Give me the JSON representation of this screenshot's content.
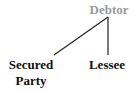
{
  "diagram": {
    "type": "tree",
    "root": {
      "label": "Debtor",
      "color": "#9a9a9a"
    },
    "children": [
      {
        "label_line1": "Secured",
        "label_line2": "Party",
        "color": "#111111"
      },
      {
        "label": "Lessee",
        "color": "#111111"
      }
    ],
    "edge_color": "#222222"
  }
}
